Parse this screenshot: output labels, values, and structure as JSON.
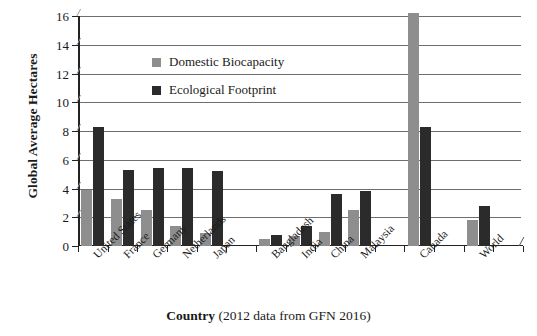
{
  "chart_data": {
    "type": "bar",
    "title": "",
    "xlabel": "Country (2012 data from GFN 2016)",
    "ylabel": "Global Average Hectares",
    "ylim": [
      0,
      16
    ],
    "yticks": [
      0,
      2,
      4,
      6,
      8,
      10,
      12,
      14,
      16
    ],
    "grid": true,
    "legend_position": "upper-left-inside",
    "categories": [
      "United States",
      "France",
      "Germany",
      "Netherlands",
      "Japan",
      "Bangladesh",
      "India",
      "China",
      "Malaysia",
      "Canada",
      "World"
    ],
    "series": [
      {
        "name": "Domestic Biocapacity",
        "color": "#8e8e8e",
        "values": [
          3.9,
          3.3,
          2.5,
          1.4,
          0.9,
          0.5,
          0.7,
          1.0,
          2.5,
          16.2,
          1.8
        ]
      },
      {
        "name": "Ecological Footprint",
        "color": "#2b2b2b",
        "values": [
          8.3,
          5.3,
          5.4,
          5.4,
          5.2,
          0.8,
          1.4,
          3.6,
          3.8,
          8.3,
          2.8
        ]
      }
    ]
  },
  "axes": {
    "y_title": "Global Average Hectares",
    "x_title_bold": "Country",
    "x_title_rest": " (2012 data from GFN 2016)"
  },
  "legend": {
    "items": [
      {
        "label": "Domestic Biocapacity",
        "color": "#8e8e8e"
      },
      {
        "label": "Ecological Footprint",
        "color": "#2b2b2b"
      }
    ]
  }
}
